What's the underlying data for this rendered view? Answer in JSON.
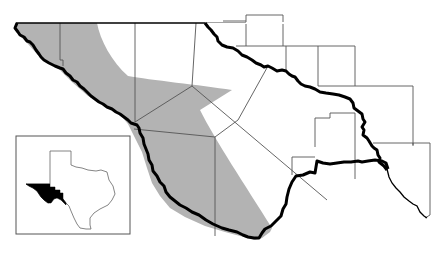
{
  "map": {
    "type": "regional county map with shaded range",
    "colors": {
      "background": "#ffffff",
      "shaded_region": "#b3b3b3",
      "county_line": "#555555",
      "river_border": "#000000",
      "inset_highlight": "#000000",
      "inset_frame": "#555555"
    },
    "layers": {
      "shaded_region": "distribution-range",
      "county_boundaries": "county-lines",
      "river_border": "international-border-rio-grande",
      "state_line_north": "state-line"
    },
    "inset": {
      "subject": "texas-outline",
      "highlight": "trans-pecos-region"
    }
  }
}
